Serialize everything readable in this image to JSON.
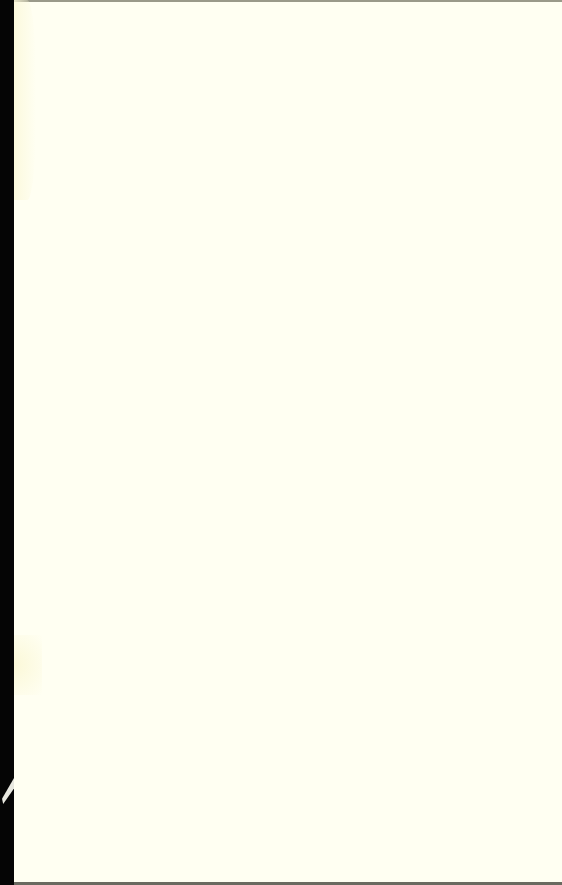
{
  "document": {
    "type": "blank-scanned-page",
    "colors": {
      "paper": "#fffff2",
      "left_margin": "#050505",
      "stain": "#fbf8d8"
    }
  }
}
